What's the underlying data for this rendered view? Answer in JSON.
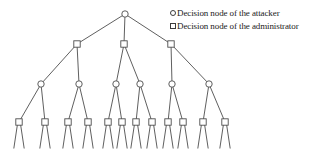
{
  "legend": {
    "items": [
      {
        "shape": "circle",
        "label": "Decision node of the attacker"
      },
      {
        "shape": "square",
        "label": "Decision node of the administrator"
      }
    ]
  },
  "diagram": {
    "colors": {
      "background": "#ffffff",
      "stroke": "#4d4d4d",
      "node_fill": "#ffffff",
      "text": "#222222"
    },
    "node_size": {
      "circle_radius": 3.2,
      "square_side": 6.4
    },
    "nodes": [
      {
        "id": 0,
        "type": "circle",
        "x": 125,
        "y": 14,
        "level": 1,
        "legs": false
      },
      {
        "id": 1,
        "type": "square",
        "x": 77,
        "y": 44,
        "level": 2,
        "legs": false
      },
      {
        "id": 2,
        "type": "square",
        "x": 124,
        "y": 44,
        "level": 2,
        "legs": false
      },
      {
        "id": 3,
        "type": "square",
        "x": 171,
        "y": 44,
        "level": 2,
        "legs": false
      },
      {
        "id": 4,
        "type": "circle",
        "x": 41,
        "y": 84,
        "level": 3,
        "legs": false
      },
      {
        "id": 5,
        "type": "circle",
        "x": 79,
        "y": 84,
        "level": 3,
        "legs": false
      },
      {
        "id": 6,
        "type": "circle",
        "x": 116,
        "y": 84,
        "level": 3,
        "legs": false
      },
      {
        "id": 7,
        "type": "circle",
        "x": 140,
        "y": 84,
        "level": 3,
        "legs": false
      },
      {
        "id": 8,
        "type": "circle",
        "x": 172,
        "y": 84,
        "level": 3,
        "legs": false
      },
      {
        "id": 9,
        "type": "circle",
        "x": 209,
        "y": 84,
        "level": 3,
        "legs": false
      },
      {
        "id": 10,
        "type": "square",
        "x": 19,
        "y": 122,
        "level": 4,
        "legs": true
      },
      {
        "id": 11,
        "type": "square",
        "x": 45,
        "y": 122,
        "level": 4,
        "legs": true
      },
      {
        "id": 12,
        "type": "square",
        "x": 68,
        "y": 122,
        "level": 4,
        "legs": true
      },
      {
        "id": 13,
        "type": "square",
        "x": 88,
        "y": 122,
        "level": 4,
        "legs": true
      },
      {
        "id": 14,
        "type": "square",
        "x": 108,
        "y": 122,
        "level": 4,
        "legs": true
      },
      {
        "id": 15,
        "type": "square",
        "x": 122,
        "y": 122,
        "level": 4,
        "legs": true
      },
      {
        "id": 16,
        "type": "square",
        "x": 136,
        "y": 122,
        "level": 4,
        "legs": true
      },
      {
        "id": 17,
        "type": "square",
        "x": 152,
        "y": 122,
        "level": 4,
        "legs": true
      },
      {
        "id": 18,
        "type": "square",
        "x": 168,
        "y": 122,
        "level": 4,
        "legs": true
      },
      {
        "id": 19,
        "type": "square",
        "x": 183,
        "y": 122,
        "level": 4,
        "legs": true
      },
      {
        "id": 20,
        "type": "square",
        "x": 203,
        "y": 122,
        "level": 4,
        "legs": true
      },
      {
        "id": 21,
        "type": "square",
        "x": 225,
        "y": 122,
        "level": 4,
        "legs": true
      }
    ],
    "edges": [
      [
        0,
        1
      ],
      [
        0,
        2
      ],
      [
        0,
        3
      ],
      [
        1,
        4
      ],
      [
        1,
        5
      ],
      [
        2,
        6
      ],
      [
        2,
        7
      ],
      [
        3,
        8
      ],
      [
        3,
        9
      ],
      [
        4,
        10
      ],
      [
        4,
        11
      ],
      [
        5,
        12
      ],
      [
        5,
        13
      ],
      [
        6,
        14
      ],
      [
        6,
        15
      ],
      [
        7,
        16
      ],
      [
        7,
        17
      ],
      [
        8,
        18
      ],
      [
        8,
        19
      ],
      [
        9,
        20
      ],
      [
        9,
        21
      ]
    ],
    "leg_geometry": {
      "y_start": 124,
      "y_end": 148.5,
      "x_spread_start": 1.5,
      "x_spread_end": 5.2
    }
  }
}
